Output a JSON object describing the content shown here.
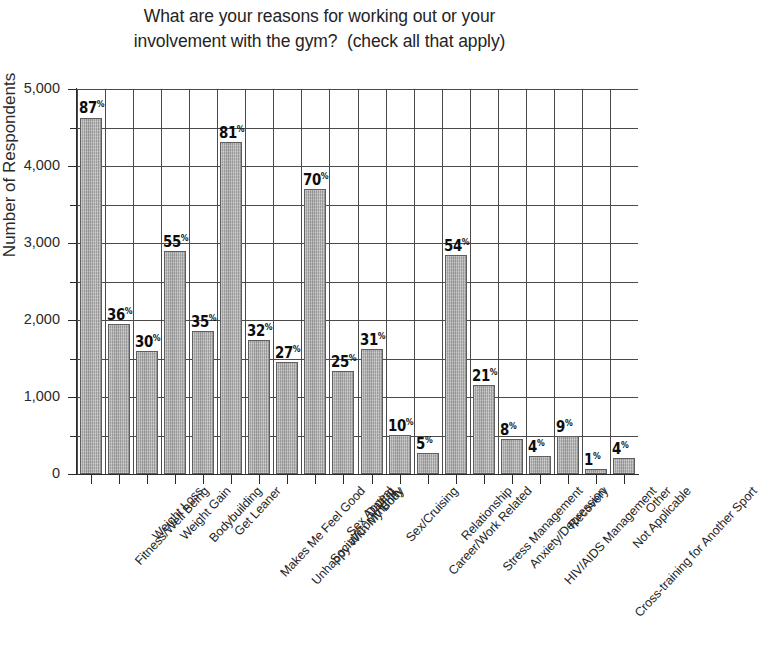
{
  "chart_data": {
    "type": "bar",
    "title": "What are your reasons for working out or your involvement with the gym?  (check all that apply)",
    "title_lines": [
      "What are your reasons for working out or your",
      "involvement with the gym?  (check all that apply)"
    ],
    "xlabel": "",
    "ylabel": "Number of Respondents",
    "ylim": [
      0,
      5000
    ],
    "ytick_labels": [
      "0",
      "1,000",
      "2,000",
      "3,000",
      "4,000",
      "5,000"
    ],
    "ytick_values": [
      0,
      1000,
      2000,
      3000,
      4000,
      5000
    ],
    "yminor_values": [
      500,
      1500,
      2500,
      3500,
      4500
    ],
    "grid": true,
    "legend": false,
    "bar_color": "#a6a6a6",
    "bar_edge_color": "#5e5e5e",
    "axis_color": "#2b2b2b",
    "grid_color": "#4a4a4a",
    "categories": [
      "Fitness/Well Being",
      "Weight Loss",
      "Weight Gain",
      "Bodybuilding",
      "Get Leaner",
      "Makes Me Feel Good",
      "Unhappy With My Body",
      "Social/Community",
      "Sex Appeal",
      "Dating",
      "Sex/Cruising",
      "Career/Work Related",
      "Relationship",
      "Stress Management",
      "Anxiety/Depression",
      "HIV/AIDS Management",
      "Recovery",
      "Cross-training for Another Sport",
      "Not Applicable",
      "Other"
    ],
    "values": [
      4630,
      1950,
      1600,
      2900,
      1860,
      4310,
      1740,
      1450,
      3700,
      1340,
      1620,
      510,
      270,
      2850,
      1150,
      450,
      240,
      490,
      60,
      210
    ],
    "data_labels": [
      "87",
      "36",
      "30",
      "55",
      "35",
      "81",
      "32",
      "27",
      "70",
      "25",
      "31",
      "10",
      "5",
      "54",
      "21",
      "8",
      "4",
      "9",
      "1",
      "4"
    ],
    "data_label_suffix": "%",
    "series": [
      {
        "name": "Number of Respondents",
        "values": [
          4630,
          1950,
          1600,
          2900,
          1860,
          4310,
          1740,
          1450,
          3700,
          1340,
          1620,
          510,
          270,
          2850,
          1150,
          450,
          240,
          490,
          60,
          210
        ],
        "percent_labels": [
          87,
          36,
          30,
          55,
          35,
          81,
          32,
          27,
          70,
          25,
          31,
          10,
          5,
          54,
          21,
          8,
          4,
          9,
          1,
          4
        ]
      }
    ]
  }
}
